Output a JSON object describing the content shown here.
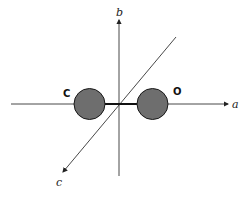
{
  "diagram": {
    "axes": {
      "a": {
        "label": "a",
        "x1": 11,
        "y1": 104,
        "x2": 228,
        "y2": 104
      },
      "b": {
        "label": "b",
        "x1": 119,
        "y1": 176,
        "x2": 119,
        "y2": 20
      },
      "c": {
        "label": "c",
        "x1": 176,
        "y1": 37,
        "x2": 63,
        "y2": 172
      }
    },
    "atoms": [
      {
        "label": "C",
        "cx": 89.5,
        "cy": 104,
        "r": 15.5,
        "label_x": 63,
        "label_y": 97
      },
      {
        "label": "O",
        "cx": 152.5,
        "cy": 104,
        "r": 15.5,
        "label_x": 173,
        "label_y": 95
      }
    ],
    "bond": {
      "x1": 105,
      "y1": 104,
      "x2": 137,
      "y2": 104
    },
    "colors": {
      "atom_fill": "#6e6e6e",
      "atom_stroke": "#1a1a1a",
      "axis": "#333333",
      "bond": "#111111"
    }
  }
}
